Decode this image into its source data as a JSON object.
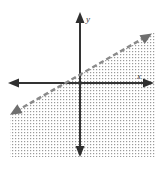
{
  "figure": {
    "kind": "coordinate-plane-inequality-graph",
    "width": 162,
    "height": 169,
    "background_color": "#ffffff"
  },
  "axes": {
    "x_axis": {
      "label": "x",
      "label_position": {
        "x": 137,
        "y": 79
      },
      "line": {
        "x1": 8,
        "y1": 83,
        "x2": 154,
        "y2": 83
      },
      "color": "#333333",
      "arrow_left": true,
      "arrow_right": true
    },
    "y_axis": {
      "label": "y",
      "label_position": {
        "x": 89,
        "y": 20
      },
      "line": {
        "x1": 80,
        "y1": 12,
        "x2": 80,
        "y2": 157
      },
      "color": "#333333",
      "arrow_up": true,
      "arrow_down": true
    },
    "origin": {
      "x": 80,
      "y": 83
    }
  },
  "boundary_line": {
    "style": "dashed",
    "color": "#8a8a8a",
    "dash_pattern": "5,3",
    "stroke_width": 2.4,
    "start_point": {
      "x": 13,
      "y": 113
    },
    "end_point": {
      "x": 149,
      "y": 35
    },
    "arrow_start": "up-left",
    "arrow_end": "down-right",
    "slope_sign": "positive",
    "x_intercept_pixel": {
      "x": 71,
      "y": 83
    }
  },
  "shaded_region": {
    "description": "region below and to the right of the dashed boundary line",
    "fill_style": "dotted-stipple",
    "dot_color": "#9a9a9a",
    "dot_spacing": 3,
    "bounds": {
      "left": 10,
      "right": 155,
      "top": 35,
      "bottom": 157
    }
  },
  "colors": {
    "axis": "#333333",
    "boundary": "#8a8a8a",
    "arrowhead": "#6f6f6f",
    "stipple": "#9a9a9a",
    "background": "#ffffff"
  }
}
